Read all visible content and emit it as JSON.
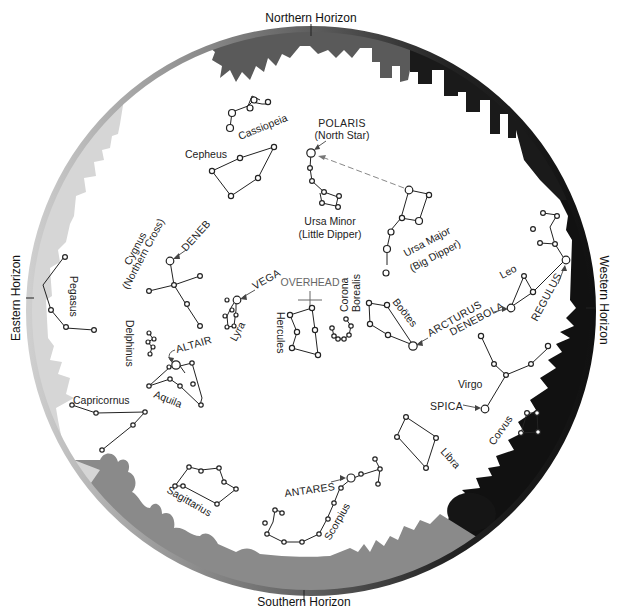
{
  "horizons": {
    "north": "Northern Horizon",
    "south": "Southern Horizon",
    "east": "Eastern Horizon",
    "west": "Western Horizon"
  },
  "overhead": "OVERHEAD",
  "constellations": {
    "cassiopeia": "Cassiopeia",
    "cepheus": "Cepheus",
    "ursa_minor": [
      "Ursa Minor",
      "(Little Dipper)"
    ],
    "ursa_major": [
      "Ursa Major",
      "(Big Dipper)"
    ],
    "cygnus": [
      "Cygnus",
      "(Northern Cross)"
    ],
    "pegasus": "Pegasus",
    "delphinus": "Delphinus",
    "lyra": "Lyra",
    "hercules": "Hercules",
    "corona_borealis": [
      "Corona",
      "Borealis"
    ],
    "bootes": "Boötes",
    "leo": "Leo",
    "virgo": "Virgo",
    "aquila": "Aquila",
    "capricornus": "Capricornus",
    "sagittarius": "Sagittarius",
    "scorpius": "Scorpius",
    "libra": "Libra",
    "corvus": "Corvus"
  },
  "stars": {
    "polaris": [
      "POLARIS",
      "(North Star)"
    ],
    "deneb": "DENEB",
    "vega": "VEGA",
    "altair": "ALTAIR",
    "arcturus": "ARCTURUS",
    "denebola": "DENEBOLA",
    "regulus": "REGULUS",
    "spica": "SPICA",
    "antares": "ANTARES"
  },
  "colors": {
    "north_silhouette": "#555555",
    "east_silhouette": "#d0d0d0",
    "south_silhouette": "#8a8a8a",
    "west_silhouette": "#111111",
    "ink": "#222222"
  }
}
